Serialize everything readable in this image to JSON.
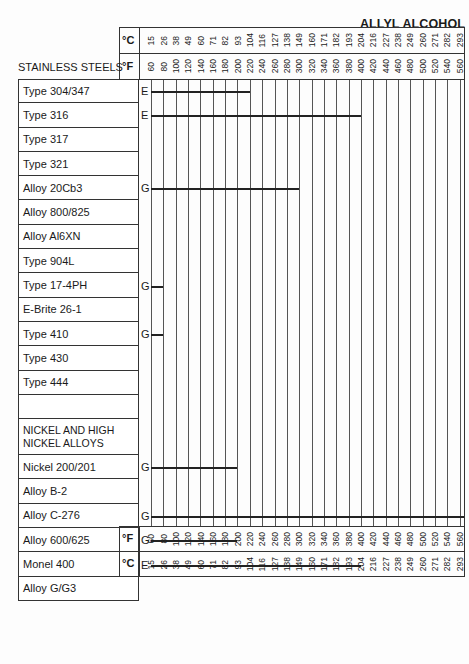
{
  "title": "ALLYL ALCOHOL",
  "section_label": "STAINLESS STEELS",
  "units": {
    "celsius": "°C",
    "fahrenheit": "°F"
  },
  "celsius_ticks": [
    "15",
    "26",
    "38",
    "49",
    "60",
    "71",
    "82",
    "93",
    "104",
    "116",
    "127",
    "138",
    "149",
    "160",
    "171",
    "182",
    "193",
    "204",
    "216",
    "227",
    "238",
    "249",
    "260",
    "271",
    "282",
    "293"
  ],
  "fahrenheit_ticks": [
    "60",
    "80",
    "100",
    "120",
    "140",
    "160",
    "180",
    "200",
    "220",
    "240",
    "260",
    "280",
    "300",
    "320",
    "340",
    "360",
    "380",
    "400",
    "420",
    "440",
    "460",
    "480",
    "500",
    "520",
    "540",
    "560"
  ],
  "rows": [
    {
      "label": "Type 304/347",
      "rating": "E",
      "max_f": 220
    },
    {
      "label": "Type 316",
      "rating": "E",
      "max_f": 400
    },
    {
      "label": "Type 317",
      "rating": "",
      "max_f": null
    },
    {
      "label": "Type 321",
      "rating": "",
      "max_f": null
    },
    {
      "label": "Alloy 20Cb3",
      "rating": "G",
      "max_f": 300
    },
    {
      "label": "Alloy 800/825",
      "rating": "",
      "max_f": null
    },
    {
      "label": "Alloy Al6XN",
      "rating": "",
      "max_f": null
    },
    {
      "label": "Type 904L",
      "rating": "",
      "max_f": null
    },
    {
      "label": "Type 17-4PH",
      "rating": "G",
      "max_f": 80
    },
    {
      "label": "E-Brite 26-1",
      "rating": "",
      "max_f": null
    },
    {
      "label": "Type 410",
      "rating": "G",
      "max_f": 80
    },
    {
      "label": "Type 430",
      "rating": "",
      "max_f": null
    },
    {
      "label": "Type 444",
      "rating": "",
      "max_f": null
    },
    {
      "label": "",
      "rating": "",
      "max_f": null
    },
    {
      "label": "NICKEL AND HIGH NICKEL ALLOYS",
      "rating": "",
      "max_f": null,
      "is_section": true
    },
    {
      "label": "Nickel 200/201",
      "rating": "G",
      "max_f": 200
    },
    {
      "label": "Alloy B-2",
      "rating": "",
      "max_f": null
    },
    {
      "label": "Alloy C-276",
      "rating": "G",
      "max_f": 570
    },
    {
      "label": "Alloy 600/625",
      "rating": "G",
      "max_f": 200
    },
    {
      "label": "Monel 400",
      "rating": "E",
      "max_f": 400
    },
    {
      "label": "Alloy G/G3",
      "rating": "",
      "max_f": null
    }
  ],
  "chart_data": {
    "type": "bar",
    "title": "ALLYL ALCOHOL",
    "xlabel": "Temperature (°F / °C)",
    "ylabel": "Material",
    "x_ticks_f": [
      60,
      80,
      100,
      120,
      140,
      160,
      180,
      200,
      220,
      240,
      260,
      280,
      300,
      320,
      340,
      360,
      380,
      400,
      420,
      440,
      460,
      480,
      500,
      520,
      540,
      560
    ],
    "x_ticks_c": [
      15,
      26,
      38,
      49,
      60,
      71,
      82,
      93,
      104,
      116,
      127,
      138,
      149,
      160,
      171,
      182,
      193,
      204,
      216,
      227,
      238,
      249,
      260,
      271,
      282,
      293
    ],
    "xlim_f": [
      60,
      570
    ],
    "categories": [
      "Type 304/347",
      "Type 316",
      "Type 317",
      "Type 321",
      "Alloy 20Cb3",
      "Alloy 800/825",
      "Alloy Al6XN",
      "Type 904L",
      "Type 17-4PH",
      "E-Brite 26-1",
      "Type 410",
      "Type 430",
      "Type 444",
      "Nickel 200/201",
      "Alloy B-2",
      "Alloy C-276",
      "Alloy 600/625",
      "Monel 400",
      "Alloy G/G3"
    ],
    "series": [
      {
        "name": "Max temperature (°F)",
        "values": [
          220,
          400,
          null,
          null,
          300,
          null,
          null,
          null,
          80,
          null,
          80,
          null,
          null,
          200,
          null,
          570,
          200,
          400,
          null
        ]
      },
      {
        "name": "Rating",
        "values": [
          "E",
          "E",
          "",
          "",
          "G",
          "",
          "",
          "",
          "G",
          "",
          "G",
          "",
          "",
          "G",
          "",
          "G",
          "G",
          "E",
          ""
        ]
      }
    ],
    "groups": [
      {
        "name": "STAINLESS STEELS",
        "range": [
          0,
          12
        ]
      },
      {
        "name": "NICKEL AND HIGH NICKEL ALLOYS",
        "range": [
          13,
          18
        ]
      }
    ],
    "grid": true
  }
}
